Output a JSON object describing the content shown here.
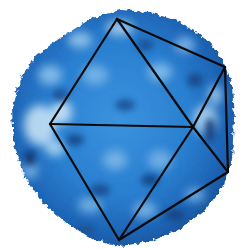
{
  "figure": {
    "subject": "icosahedral virus capsid surface rendering with icosahedron wireframe overlay",
    "colors": {
      "background": "#ffffff",
      "capsid_base": "#2a7fd0",
      "capsid_highlight": "#9fd0f2",
      "capsid_light": "#d6ecf8",
      "capsid_shadow": "#0f3b7a",
      "wireframe": "#0a0a0a"
    },
    "wireframe": {
      "vertices": {
        "top": [
          117,
          19
        ],
        "right_upper": [
          225,
          67
        ],
        "left": [
          50,
          124
        ],
        "center_right": [
          193,
          127
        ],
        "right_lower": [
          228,
          172
        ],
        "bottom": [
          119,
          240
        ]
      },
      "edges": [
        [
          "top",
          "left"
        ],
        [
          "top",
          "center_right"
        ],
        [
          "top",
          "right_upper"
        ],
        [
          "right_upper",
          "right_lower"
        ],
        [
          "right_upper",
          "center_right"
        ],
        [
          "left",
          "center_right"
        ],
        [
          "left",
          "bottom"
        ],
        [
          "center_right",
          "right_lower"
        ],
        [
          "center_right",
          "bottom"
        ],
        [
          "bottom",
          "right_lower"
        ]
      ]
    }
  }
}
